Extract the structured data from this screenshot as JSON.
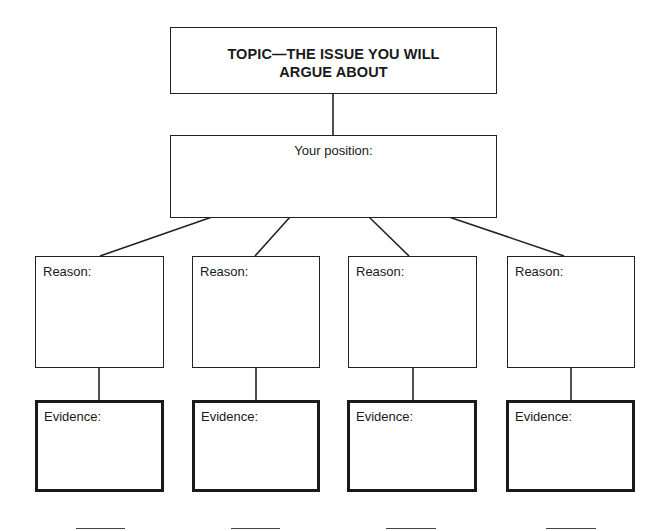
{
  "diagram": {
    "type": "argument-organizer",
    "topic": {
      "label": "TOPIC—THE ISSUE YOU WILL\nARGUE ABOUT"
    },
    "position": {
      "label": "Your position:"
    },
    "reasons": [
      {
        "label": "Reason:"
      },
      {
        "label": "Reason:"
      },
      {
        "label": "Reason:"
      },
      {
        "label": "Reason:"
      }
    ],
    "evidence": [
      {
        "label": "Evidence:"
      },
      {
        "label": "Evidence:"
      },
      {
        "label": "Evidence:"
      },
      {
        "label": "Evidence:"
      }
    ],
    "blank_lines_count": 4,
    "colors": {
      "line": "#222222",
      "background": "#ffffff",
      "text": "#1a1a1a"
    }
  }
}
